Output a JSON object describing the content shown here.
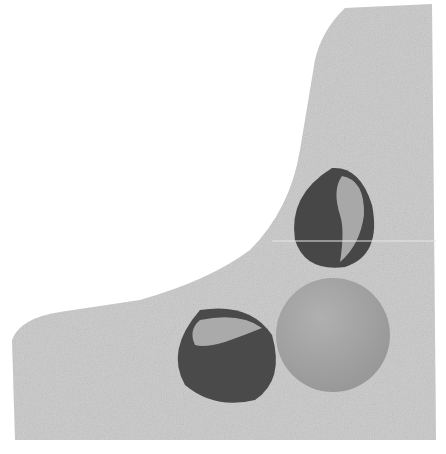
{
  "image": {
    "description": "Grayscale photo: two dark chestnut-like seeds with lighter hilum patches and a smooth light-gray sphere resting in a speckled gray L-shaped shadow area on white background",
    "colors": {
      "background": "#ffffff",
      "shadow": "#c8c8c8",
      "seed_dark": "#4a4a4a",
      "seed_hilum": "#a9a9a9",
      "sphere": "#a2a2a2"
    },
    "objects": [
      {
        "name": "upper-seed",
        "cx": 335,
        "cy": 217,
        "rx": 45,
        "ry": 50
      },
      {
        "name": "lower-seed",
        "cx": 225,
        "cy": 358,
        "rx": 52,
        "ry": 45
      },
      {
        "name": "sphere",
        "cx": 333,
        "cy": 335,
        "r": 57
      }
    ]
  }
}
